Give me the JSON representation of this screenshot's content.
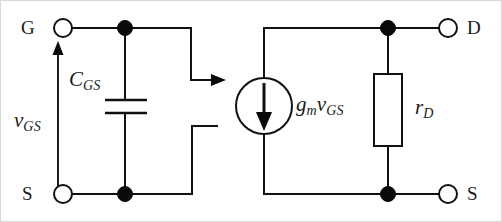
{
  "figure": {
    "background_color": "#ffffff",
    "line_color": "#111111",
    "width": 502,
    "height": 222
  },
  "terminals": {
    "gate": {
      "label": "G",
      "x": 62,
      "y": 27
    },
    "source_left": {
      "label": "S",
      "x": 62,
      "y": 193
    },
    "drain": {
      "label": "D",
      "x": 447,
      "y": 27
    },
    "source_right": {
      "label": "S",
      "x": 447,
      "y": 193
    }
  },
  "components": {
    "capacitor": {
      "symbol": "C",
      "subscript": "GS",
      "name": "gate-source-capacitance"
    },
    "voltage_arrow": {
      "symbol": "v",
      "subscript": "GS",
      "name": "gate-source-voltage",
      "direction": "up"
    },
    "current_source": {
      "symbol_main": "g",
      "symbol_main_sub": "m",
      "symbol_second": "v",
      "symbol_second_sub": "GS",
      "name": "dependent-current-source",
      "arrow_direction": "down"
    },
    "resistor": {
      "symbol": "r",
      "subscript": "D",
      "name": "drain-resistance"
    }
  },
  "connectors": {
    "coupling_arrow": {
      "name": "controlled-source-coupling-arrow",
      "direction": "right"
    }
  },
  "nodes": [
    {
      "name": "gate-node",
      "x": 122,
      "y": 27
    },
    {
      "name": "source-node-left",
      "x": 122,
      "y": 193
    },
    {
      "name": "drain-node",
      "x": 387,
      "y": 27
    },
    {
      "name": "source-node-right",
      "x": 387,
      "y": 193
    }
  ]
}
